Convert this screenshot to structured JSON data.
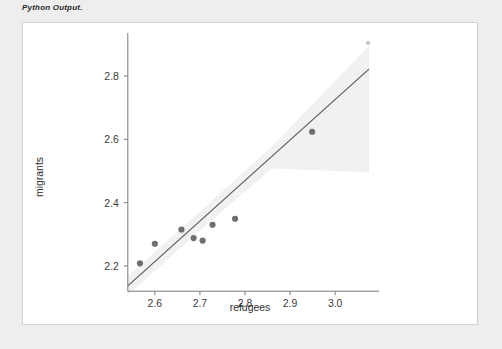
{
  "caption": "Python Output.",
  "figure": {
    "background_color": "#ffffff",
    "border_color": "#d3d3d3",
    "page_background": "#eeeeee"
  },
  "chart_data": {
    "type": "scatter",
    "title": "",
    "subtitle": "",
    "xlabel": "refugees",
    "ylabel": "migrants",
    "xlim": [
      2.54,
      3.08
    ],
    "ylim": [
      2.12,
      2.93
    ],
    "xticks": [
      2.6,
      2.7,
      2.8,
      2.9,
      3.0
    ],
    "xtick_labels": [
      "2.6",
      "2.7",
      "2.8",
      "2.9",
      "3.0"
    ],
    "yticks": [
      2.2,
      2.4,
      2.6,
      2.8
    ],
    "ytick_labels": [
      "2.2",
      "2.4",
      "2.6",
      "2.8"
    ],
    "grid": false,
    "legend": "none",
    "marker_color": "#6e6e6e",
    "line_color": "#5a5a5a",
    "band_color": "#b8b8b8",
    "points": [
      {
        "x": 2.567,
        "y": 2.208
      },
      {
        "x": 2.6,
        "y": 2.27
      },
      {
        "x": 2.659,
        "y": 2.315
      },
      {
        "x": 2.686,
        "y": 2.288
      },
      {
        "x": 2.706,
        "y": 2.28
      },
      {
        "x": 2.728,
        "y": 2.33
      },
      {
        "x": 2.778,
        "y": 2.349
      },
      {
        "x": 2.949,
        "y": 2.624
      },
      {
        "x": 3.073,
        "y": 2.905
      }
    ],
    "regression_line": {
      "x_start": 2.54,
      "y_start": 2.137,
      "x_end": 3.075,
      "y_end": 2.822,
      "slope": 1.28,
      "intercept": -1.113
    },
    "confidence_band": {
      "upper": [
        {
          "x": 2.54,
          "y": 2.168
        },
        {
          "x": 2.7,
          "y": 2.372
        },
        {
          "x": 2.86,
          "y": 2.578
        },
        {
          "x": 3.075,
          "y": 2.895
        }
      ],
      "lower": [
        {
          "x": 2.54,
          "y": 2.107
        },
        {
          "x": 2.7,
          "y": 2.312
        },
        {
          "x": 2.86,
          "y": 2.508
        },
        {
          "x": 3.075,
          "y": 2.496
        }
      ]
    }
  }
}
